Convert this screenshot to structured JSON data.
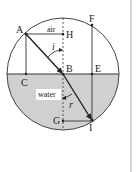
{
  "figure": {
    "type": "refraction-diagram",
    "medium_top_label": "air",
    "medium_bottom_label": "water",
    "angle_incidence_label": "i",
    "angle_refraction_label": "r",
    "points": {
      "A": "A",
      "B": "B",
      "C": "C",
      "E": "E",
      "F": "F",
      "G": "G",
      "H": "H",
      "I": "I"
    },
    "colors": {
      "water_fill": "#d0d0d0",
      "line": "#333333",
      "circle_stroke": "#444444",
      "right_rule": "#bbbbbb",
      "label_bg": "#ffffff"
    }
  }
}
